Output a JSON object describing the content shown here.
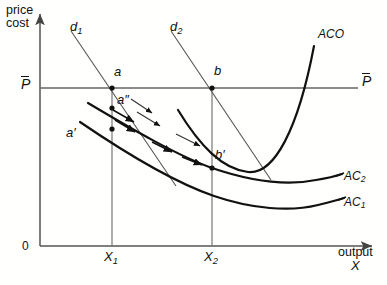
{
  "figure": {
    "type": "economics-diagram",
    "axes": {
      "y_label_line1": "price",
      "y_label_line2": "cost",
      "x_label_line1": "output",
      "x_label_line2": "X",
      "origin_label": "0",
      "x_ticks": [
        "X1",
        "X2"
      ],
      "x_tick_labels": [
        {
          "base": "X",
          "sub": "1"
        },
        {
          "base": "X",
          "sub": "2"
        }
      ]
    },
    "price_line": {
      "label_left": "P",
      "label_right": "P",
      "overbar": true,
      "description": "horizontal price line P-bar"
    },
    "curves": [
      {
        "name": "d1",
        "base": "d",
        "sub": "1",
        "kind": "demand",
        "style": "thin-straight",
        "label": "d1"
      },
      {
        "name": "d2",
        "base": "d",
        "sub": "2",
        "kind": "demand",
        "style": "thin-straight",
        "label": "d2"
      },
      {
        "name": "ACO",
        "base": "ACO",
        "sub": "",
        "kind": "average-cost",
        "style": "thick-u-shaped",
        "label": "ACO"
      },
      {
        "name": "AC2",
        "base": "AC",
        "sub": "2",
        "kind": "average-cost",
        "style": "thick-u-shaped",
        "label": "AC2"
      },
      {
        "name": "AC1",
        "base": "AC",
        "sub": "1",
        "kind": "average-cost",
        "style": "thick-u-shaped",
        "label": "AC1"
      }
    ],
    "points": [
      {
        "label": "a",
        "base": "a",
        "prime": "",
        "on": "price-line at X1"
      },
      {
        "label": "a''",
        "base": "a",
        "prime": "″",
        "on": "AC2 at X1"
      },
      {
        "label": "a'",
        "base": "a",
        "prime": "′",
        "on": "AC1 at X1"
      },
      {
        "label": "b",
        "base": "b",
        "prime": "",
        "on": "price-line at X2"
      },
      {
        "label": "b'",
        "base": "b",
        "prime": "′",
        "on": "AC curves at X2"
      }
    ],
    "colors": {
      "ink": "#111111",
      "axis": "#555555",
      "thin_line": "#555555",
      "background": "#ffffff"
    }
  }
}
